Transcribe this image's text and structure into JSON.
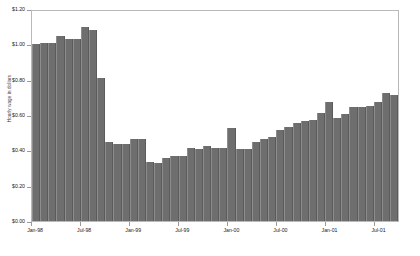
{
  "chart_data": {
    "type": "bar",
    "title": "",
    "xlabel": "",
    "ylabel": "Hourly wage in dollars",
    "ylim": [
      0,
      1.2
    ],
    "grid": false,
    "legend": null,
    "bar_color": "#6e6e6e",
    "ytick_labels": [
      "$1.20",
      "$1.00",
      "$0.80",
      "$0.60",
      "$0.40",
      "$0.20",
      "$0.00"
    ],
    "ytick_values": [
      1.2,
      1.0,
      0.8,
      0.6,
      0.4,
      0.2,
      0.0
    ],
    "xtick_labels": [
      "Jan-98",
      "Jul-98",
      "Jan-99",
      "Jul-99",
      "Jan-00",
      "Jul-00",
      "Jan-01",
      "Jul-01"
    ],
    "xtick_indices": [
      0,
      6,
      12,
      18,
      24,
      30,
      36,
      42
    ],
    "categories": [
      "Jan-98",
      "Feb-98",
      "Mar-98",
      "Apr-98",
      "May-98",
      "Jun-98",
      "Jul-98",
      "Aug-98",
      "Sep-98",
      "Oct-98",
      "Nov-98",
      "Dec-98",
      "Jan-99",
      "Feb-99",
      "Mar-99",
      "Apr-99",
      "May-99",
      "Jun-99",
      "Jul-99",
      "Aug-99",
      "Sep-99",
      "Oct-99",
      "Nov-99",
      "Dec-99",
      "Jan-00",
      "Feb-00",
      "Mar-00",
      "Apr-00",
      "May-00",
      "Jun-00",
      "Jul-00",
      "Aug-00",
      "Sep-00",
      "Oct-00",
      "Nov-00",
      "Dec-00",
      "Jan-01",
      "Feb-01",
      "Mar-01",
      "Apr-01",
      "May-01",
      "Jun-01",
      "Jul-01",
      "Aug-01",
      "Sep-01"
    ],
    "values": [
      1.01,
      1.02,
      1.02,
      1.06,
      1.04,
      1.04,
      1.11,
      1.09,
      0.82,
      0.45,
      0.44,
      0.44,
      0.47,
      0.47,
      0.34,
      0.33,
      0.36,
      0.37,
      0.37,
      0.42,
      0.41,
      0.43,
      0.42,
      0.42,
      0.53,
      0.41,
      0.41,
      0.45,
      0.47,
      0.48,
      0.52,
      0.54,
      0.56,
      0.57,
      0.58,
      0.62,
      0.68,
      0.59,
      0.61,
      0.65,
      0.65,
      0.66,
      0.68,
      0.73,
      0.72
    ]
  }
}
